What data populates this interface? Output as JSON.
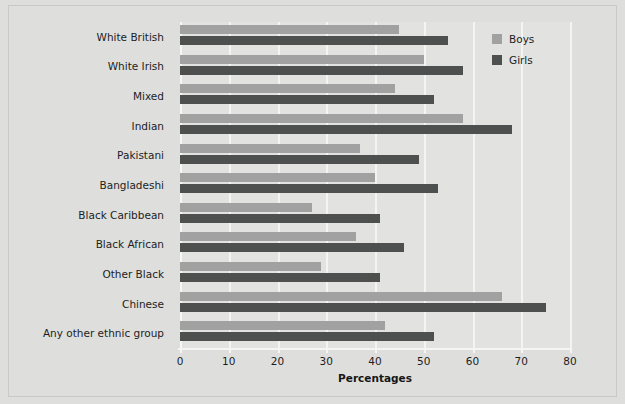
{
  "chart_data": {
    "type": "bar",
    "orientation": "horizontal",
    "title": "",
    "xlabel": "Percentages",
    "ylabel": "",
    "xlim": [
      0,
      80
    ],
    "xticks": [
      0,
      10,
      20,
      30,
      40,
      50,
      60,
      70,
      80
    ],
    "xtick_labels": [
      "0",
      "10",
      "20",
      "30",
      "40",
      "50",
      "60",
      "70",
      "80"
    ],
    "grid": true,
    "legend_position": "top-right",
    "categories": [
      "White British",
      "White Irish",
      "Mixed",
      "Indian",
      "Pakistani",
      "Bangladeshi",
      "Black Caribbean",
      "Black African",
      "Other Black",
      "Chinese",
      "Any other ethnic group"
    ],
    "series": [
      {
        "name": "Boys",
        "color": "#a0a1a0",
        "values": [
          45,
          50,
          44,
          58,
          37,
          40,
          27,
          36,
          29,
          66,
          42
        ]
      },
      {
        "name": "Girls",
        "color": "#4e4f4f",
        "values": [
          55,
          58,
          52,
          68,
          49,
          53,
          41,
          46,
          41,
          75,
          52
        ]
      }
    ]
  },
  "legend": {
    "entries": [
      {
        "label": "Boys"
      },
      {
        "label": "Girls"
      }
    ]
  },
  "colors": {
    "background": "#dedfdd",
    "plot_background": "#e2e3e1",
    "gridline": "#f4f4f2",
    "boys": "#a0a1a0",
    "girls": "#4e4f4f",
    "text": "#1d1d1d"
  }
}
